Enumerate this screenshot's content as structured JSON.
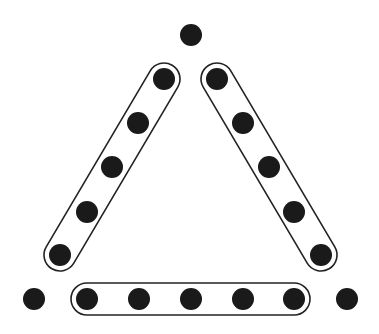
{
  "diagram": {
    "colors": {
      "background": "#ffffff",
      "dot": "#1a1a1a",
      "outline": "#222222"
    },
    "dot_radius": 11,
    "corner_dots": [
      {
        "id": "top",
        "x": 191,
        "y": 35
      },
      {
        "id": "bottom-left",
        "x": 34,
        "y": 299
      },
      {
        "id": "bottom-right",
        "x": 347,
        "y": 299
      }
    ],
    "groups": [
      {
        "id": "left-side",
        "dots": [
          [
            164,
            79
          ],
          [
            138,
            123
          ],
          [
            112,
            167
          ],
          [
            87,
            212
          ],
          [
            60,
            255
          ]
        ]
      },
      {
        "id": "right-side",
        "dots": [
          [
            217,
            79
          ],
          [
            243,
            123
          ],
          [
            269,
            167
          ],
          [
            294,
            212
          ],
          [
            321,
            255
          ]
        ]
      },
      {
        "id": "bottom-side",
        "dots": [
          [
            87,
            299
          ],
          [
            139,
            299
          ],
          [
            191,
            299
          ],
          [
            243,
            299
          ],
          [
            294,
            299
          ]
        ]
      }
    ],
    "pill_half_width": 16,
    "counts": {
      "total_dots": 18,
      "grouped_dots": 15,
      "ungrouped_dots": 3,
      "groups": 3
    }
  }
}
